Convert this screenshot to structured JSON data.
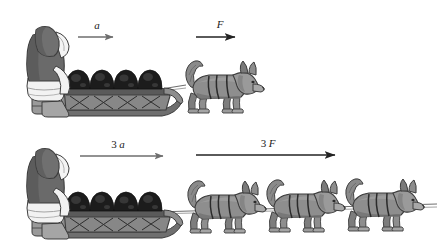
{
  "figure": {
    "background_color": "#ffffff",
    "width": 443,
    "height": 245
  },
  "panels": [
    {
      "id": "panel-top",
      "name": "one-dog-panel",
      "dog_count": 1,
      "musher_label": "person",
      "sled_label": "loaded sled",
      "cargo_bundles": 4,
      "vectors": [
        {
          "id": "acceleration-vector-top",
          "name": "acceleration-arrow",
          "number": "",
          "symbol": "a",
          "label": "a",
          "color": "#6e6e6e",
          "length_px": 40,
          "stroke_width": 1.4,
          "x1": 78,
          "y1": 37,
          "x2": 118,
          "y2": 37,
          "label_x": 96,
          "label_y": 28
        },
        {
          "id": "force-vector-top",
          "name": "force-arrow",
          "number": "",
          "symbol": "F",
          "label": "F",
          "color": "#232323",
          "length_px": 49,
          "stroke_width": 1.7,
          "x1": 196,
          "y1": 37,
          "x2": 245,
          "y2": 37,
          "label_x": 219,
          "label_y": 27
        }
      ]
    },
    {
      "id": "panel-bottom",
      "name": "three-dog-panel",
      "dog_count": 3,
      "musher_label": "person",
      "sled_label": "loaded sled",
      "cargo_bundles": 4,
      "vectors": [
        {
          "id": "acceleration-vector-bottom",
          "name": "acceleration-arrow",
          "number": "3",
          "symbol": "a",
          "label": "3 a",
          "color": "#6e6e6e",
          "length_px": 88,
          "stroke_width": 1.4,
          "x1": 80,
          "y1": 156,
          "x2": 168,
          "y2": 156,
          "label_x": 118,
          "label_y": 147
        },
        {
          "id": "force-vector-bottom",
          "name": "force-arrow",
          "number": "3",
          "symbol": "F",
          "label": "3 F",
          "color": "#232323",
          "length_px": 149,
          "stroke_width": 1.7,
          "x1": 196,
          "y1": 155,
          "x2": 345,
          "y2": 155,
          "label_x": 268,
          "label_y": 146
        }
      ]
    }
  ],
  "colors": {
    "parka_body": "#6a6a6a",
    "parka_shadow": "#4f4f4f",
    "fur_trim": "#f2f2f2",
    "fur_trim_line": "#8a8a8a",
    "boots": "#9a9a9a",
    "sled_body": "#8d8d8d",
    "sled_dark": "#4a4a4a",
    "cargo": "#1c1c1c",
    "cargo_light": "#3a3a3a",
    "dog_body": "#8e8e8e",
    "dog_shadow": "#6f6f6f",
    "dog_light": "#a8a8a8",
    "outline": "#3d3d3d",
    "rope": "#6f6f6f",
    "arrow_gray": "#6e6e6e",
    "arrow_black": "#232323"
  },
  "dogs": {
    "top_row": [
      {
        "id": "dog-1",
        "x": 178,
        "y": 56,
        "scale": 1.0
      }
    ],
    "bottom_row": [
      {
        "id": "dog-1",
        "x": 183,
        "y": 176,
        "scale": 1.0
      },
      {
        "id": "dog-2",
        "x": 262,
        "y": 176,
        "scale": 1.0
      },
      {
        "id": "dog-3",
        "x": 341,
        "y": 176,
        "scale": 1.0
      }
    ]
  }
}
